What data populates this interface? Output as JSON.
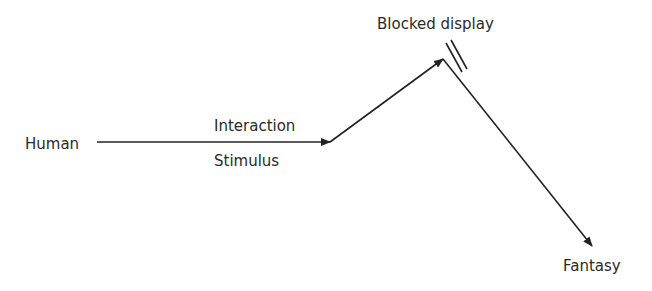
{
  "nodes": {
    "human": "Human",
    "blocked": "Blocked display",
    "fantasy": "Fantasy"
  },
  "edges": {
    "interaction": "Interaction",
    "stimulus": "Stimulus"
  },
  "colors": {
    "line": "#222222",
    "text": "#2a2a2a"
  }
}
